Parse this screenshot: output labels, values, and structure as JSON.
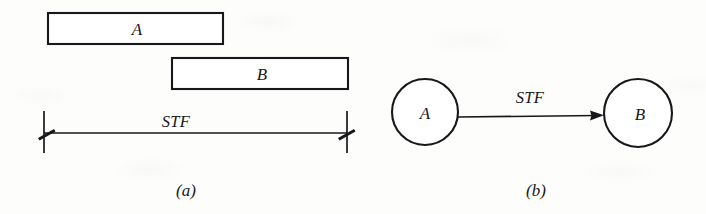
{
  "figure": {
    "background_color": "#fdfdfc",
    "ink_color": "#18181a",
    "panels": [
      {
        "id": "a",
        "caption": "(a)",
        "caption_x": 186,
        "caption_y": 196,
        "type": "bar-chart-schedule",
        "bars": [
          {
            "label": "A",
            "x": 48,
            "y": 13,
            "width": 175,
            "height": 31,
            "label_x": 137,
            "label_y": 35
          },
          {
            "label": "B",
            "x": 172,
            "y": 58,
            "width": 176,
            "height": 31,
            "label_x": 262,
            "label_y": 80
          }
        ],
        "dimension": {
          "label": "STF",
          "label_x": 176,
          "label_y": 127,
          "line_y": 133,
          "x_start": 44,
          "x_end": 347,
          "tick_top": 111,
          "tick_bottom": 153
        }
      },
      {
        "id": "b",
        "caption": "(b)",
        "caption_x": 536,
        "caption_y": 196,
        "type": "node-network",
        "nodes": [
          {
            "label": "A",
            "cx": 425,
            "cy": 112,
            "r": 33,
            "label_x": 425,
            "label_y": 119
          },
          {
            "label": "B",
            "cx": 638,
            "cy": 113,
            "r": 34,
            "label_x": 640,
            "label_y": 120
          }
        ],
        "link": {
          "label": "STF",
          "label_x": 530,
          "label_y": 103,
          "from": "A",
          "to": "B",
          "x_start": 458,
          "y_start": 117,
          "x_end": 604,
          "y_end": 115
        }
      }
    ]
  }
}
